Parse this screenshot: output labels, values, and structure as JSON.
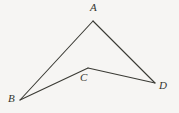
{
  "figure": {
    "name": "geometry-quadrilateral-abcd",
    "type": "concave-quadrilateral",
    "background_color": "#f6f5f3",
    "stroke_color": "#3a3a34",
    "stroke_width": 1.1,
    "canvas": {
      "width": 179,
      "height": 113
    },
    "vertices": [
      {
        "id": "A",
        "label": "A",
        "x": 93,
        "y": 21,
        "label_x": 90,
        "label_y": 2
      },
      {
        "id": "B",
        "label": "B",
        "x": 20,
        "y": 100,
        "label_x": 8,
        "label_y": 93
      },
      {
        "id": "C",
        "label": "C",
        "x": 88,
        "y": 68,
        "label_x": 80,
        "label_y": 72
      },
      {
        "id": "D",
        "label": "D",
        "x": 155,
        "y": 83,
        "label_x": 159,
        "label_y": 80
      }
    ],
    "edges": [
      {
        "id": "AB",
        "from": "A",
        "to": "B",
        "path": "M 93 21 L 20 100"
      },
      {
        "id": "BC",
        "from": "B",
        "to": "C",
        "path": "M 20 100 L 88 68"
      },
      {
        "id": "CD",
        "from": "C",
        "to": "D",
        "path": "M 88 68 L 155 83"
      },
      {
        "id": "DA",
        "from": "D",
        "to": "A",
        "path": "M 155 83 L 93 21"
      }
    ],
    "outline_path": "M 93 21 L 20 100 L 88 68 L 155 83 Z"
  }
}
